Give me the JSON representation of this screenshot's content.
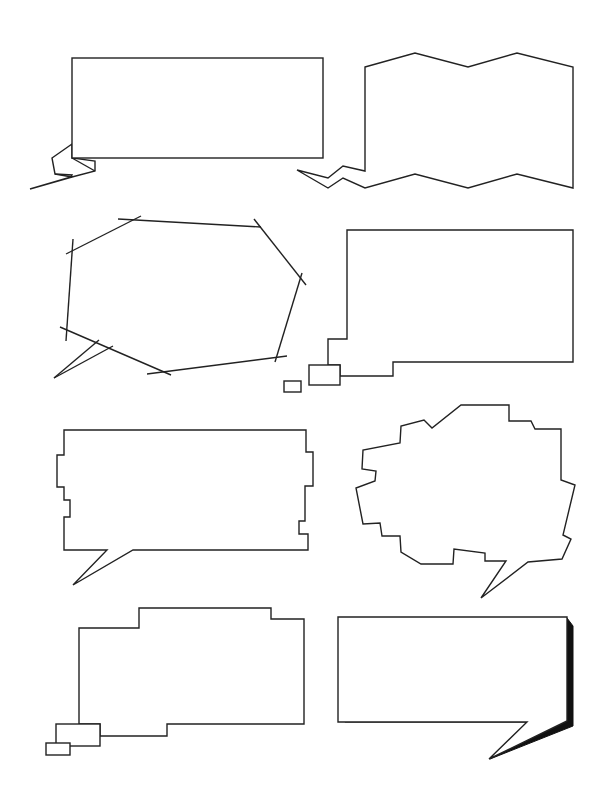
{
  "colors": {
    "background": "#ffffff",
    "stroke": "#222222",
    "shadow": "#111111"
  },
  "bubbles": [
    {
      "id": "folded-ribbon-rect",
      "label": "Rectangle bubble with folded tail",
      "text": ""
    },
    {
      "id": "zigzag-banner",
      "label": "Zigzag banner bubble with lightning tail",
      "text": ""
    },
    {
      "id": "sketch-octagon",
      "label": "Sketchy octagon bubble with crossed lines",
      "text": ""
    },
    {
      "id": "stepped-thought-rect",
      "label": "Stepped rectangle thought bubble",
      "text": ""
    },
    {
      "id": "notched-rect",
      "label": "Notched rectangle bubble with tail",
      "text": ""
    },
    {
      "id": "jagged-cloud",
      "label": "Jagged cloud bubble with tail",
      "text": ""
    },
    {
      "id": "stepped-thought-tall",
      "label": "Stepped thought bubble",
      "text": ""
    },
    {
      "id": "shadowed-rect",
      "label": "Drop-shadow rectangle bubble with tail",
      "text": ""
    }
  ]
}
